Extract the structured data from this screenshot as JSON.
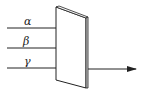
{
  "diagram": {
    "rays": [
      {
        "label": "α",
        "y": 28,
        "arrow": true
      },
      {
        "label": "β",
        "y": 48,
        "arrow": true
      },
      {
        "label": "γ",
        "y": 68,
        "arrow": false
      }
    ],
    "output_ray": {
      "y": 69
    },
    "colors": {
      "stroke": "#222222",
      "background": "#ffffff"
    }
  }
}
